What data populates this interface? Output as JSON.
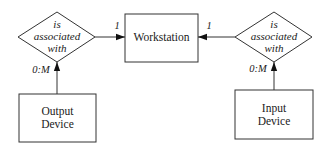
{
  "diagram": {
    "type": "entity-relationship",
    "entities": [
      {
        "id": "workstation",
        "label": "Workstation"
      },
      {
        "id": "output_device",
        "label_line1": "Output",
        "label_line2": "Device"
      },
      {
        "id": "input_device",
        "label_line1": "Input",
        "label_line2": "Device"
      }
    ],
    "relationships": [
      {
        "id": "rel_left",
        "label_line1": "is",
        "label_line2": "associated",
        "label_line3": "with",
        "from": "output_device",
        "to": "workstation",
        "cardinality_to": "1",
        "cardinality_from": "0:M"
      },
      {
        "id": "rel_right",
        "label_line1": "is",
        "label_line2": "associated",
        "label_line3": "with",
        "from": "input_device",
        "to": "workstation",
        "cardinality_to": "1",
        "cardinality_from": "0:M"
      }
    ],
    "colors": {
      "stroke": "#222222",
      "text": "#1a1a1a",
      "background": "#ffffff"
    }
  }
}
